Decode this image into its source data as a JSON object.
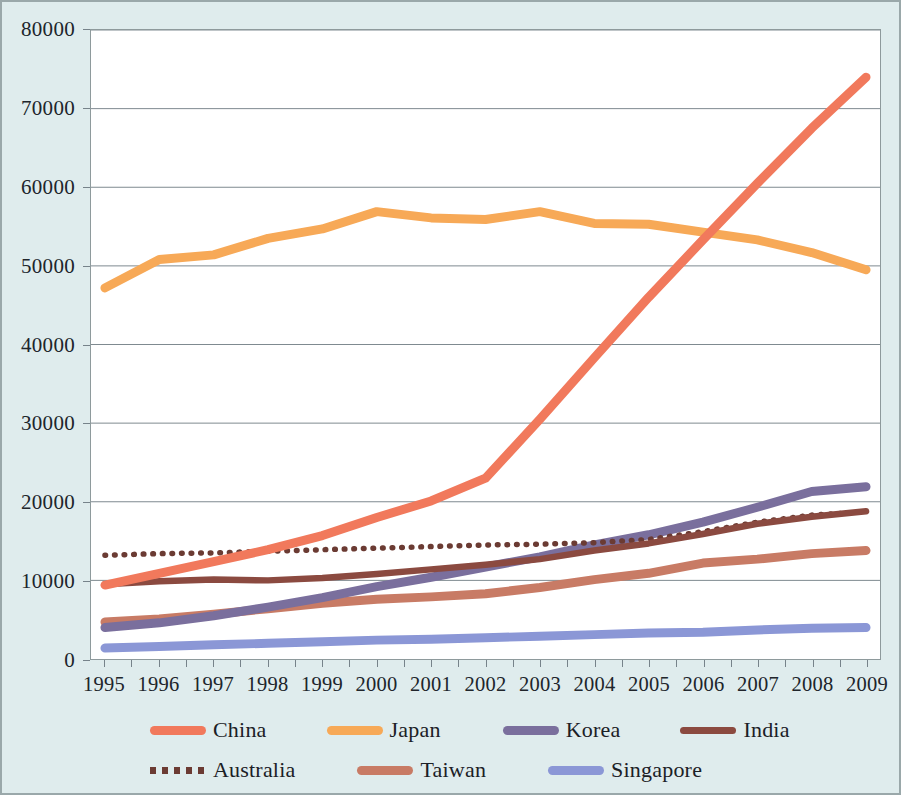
{
  "chart_data": {
    "type": "line",
    "title": "",
    "subtitle": "",
    "xlabel": "",
    "ylabel": "",
    "categories": [
      "1995",
      "1996",
      "1997",
      "1998",
      "1999",
      "2000",
      "2001",
      "2002",
      "2003",
      "2004",
      "2005",
      "2006",
      "2007",
      "2008",
      "2009"
    ],
    "x": [
      1995,
      1996,
      1997,
      1998,
      1999,
      2000,
      2001,
      2002,
      2003,
      2004,
      2005,
      2006,
      2007,
      2008,
      2009
    ],
    "xlim": [
      1995,
      2009
    ],
    "ylim": [
      0,
      80000
    ],
    "y_ticks": [
      0,
      10000,
      20000,
      30000,
      40000,
      50000,
      60000,
      70000,
      80000
    ],
    "grid": "horizontal",
    "legend_position": "bottom",
    "series": [
      {
        "name": "China",
        "color": "#f1795c",
        "style": "solid",
        "values": [
          9400,
          10900,
          12400,
          13900,
          15700,
          18000,
          20100,
          23000,
          30500,
          38300,
          46000,
          53300,
          60500,
          67500,
          74000
        ]
      },
      {
        "name": "Japan",
        "color": "#f7a957",
        "style": "solid",
        "values": [
          47200,
          50800,
          51400,
          53500,
          54700,
          56900,
          56100,
          55900,
          56900,
          55400,
          55300,
          54300,
          53300,
          51700,
          49500
        ]
      },
      {
        "name": "Korea",
        "color": "#7a6f9d",
        "style": "solid",
        "values": [
          4000,
          4600,
          5500,
          6600,
          7800,
          9200,
          10400,
          11700,
          13000,
          14500,
          15800,
          17400,
          19300,
          21300,
          21900
        ]
      },
      {
        "name": "India",
        "color": "#8b4a40",
        "style": "solid",
        "values": [
          9500,
          9900,
          10100,
          10000,
          10300,
          10800,
          11400,
          12000,
          12700,
          13800,
          14700,
          15900,
          17200,
          18100,
          18800
        ]
      },
      {
        "name": "Australia",
        "color": "#6b3b33",
        "style": "dotted",
        "values": [
          13200,
          13400,
          13500,
          13700,
          13900,
          14100,
          14300,
          14500,
          14600,
          14800,
          15200,
          16200,
          17400,
          18300,
          18700
        ]
      },
      {
        "name": "Taiwan",
        "color": "#c87b65",
        "style": "solid",
        "values": [
          4700,
          5100,
          5700,
          6400,
          7100,
          7600,
          7900,
          8300,
          9100,
          10100,
          10900,
          12200,
          12700,
          13400,
          13800
        ]
      },
      {
        "name": "Singapore",
        "color": "#8b97d6",
        "style": "solid",
        "values": [
          1400,
          1600,
          1800,
          2000,
          2200,
          2400,
          2500,
          2700,
          2900,
          3100,
          3300,
          3400,
          3700,
          3900,
          4000
        ]
      }
    ]
  },
  "axes": {
    "y_tick_labels": [
      "0",
      "10000",
      "20000",
      "30000",
      "40000",
      "50000",
      "60000",
      "70000",
      "80000"
    ],
    "x_tick_labels": [
      "1995",
      "1996",
      "1997",
      "1998",
      "1999",
      "2000",
      "2001",
      "2002",
      "2003",
      "2004",
      "2005",
      "2006",
      "2007",
      "2008",
      "2009"
    ]
  },
  "legend": {
    "rows": [
      [
        "China",
        "Japan",
        "Korea",
        "India"
      ],
      [
        "Australia",
        "Taiwan",
        "Singapore"
      ]
    ]
  },
  "colors": {
    "background": "#dfeced",
    "plot_background": "#ffffff",
    "gridline": "#7e8a90",
    "border": "#9aa8aa",
    "axis_text": "#20252b"
  }
}
